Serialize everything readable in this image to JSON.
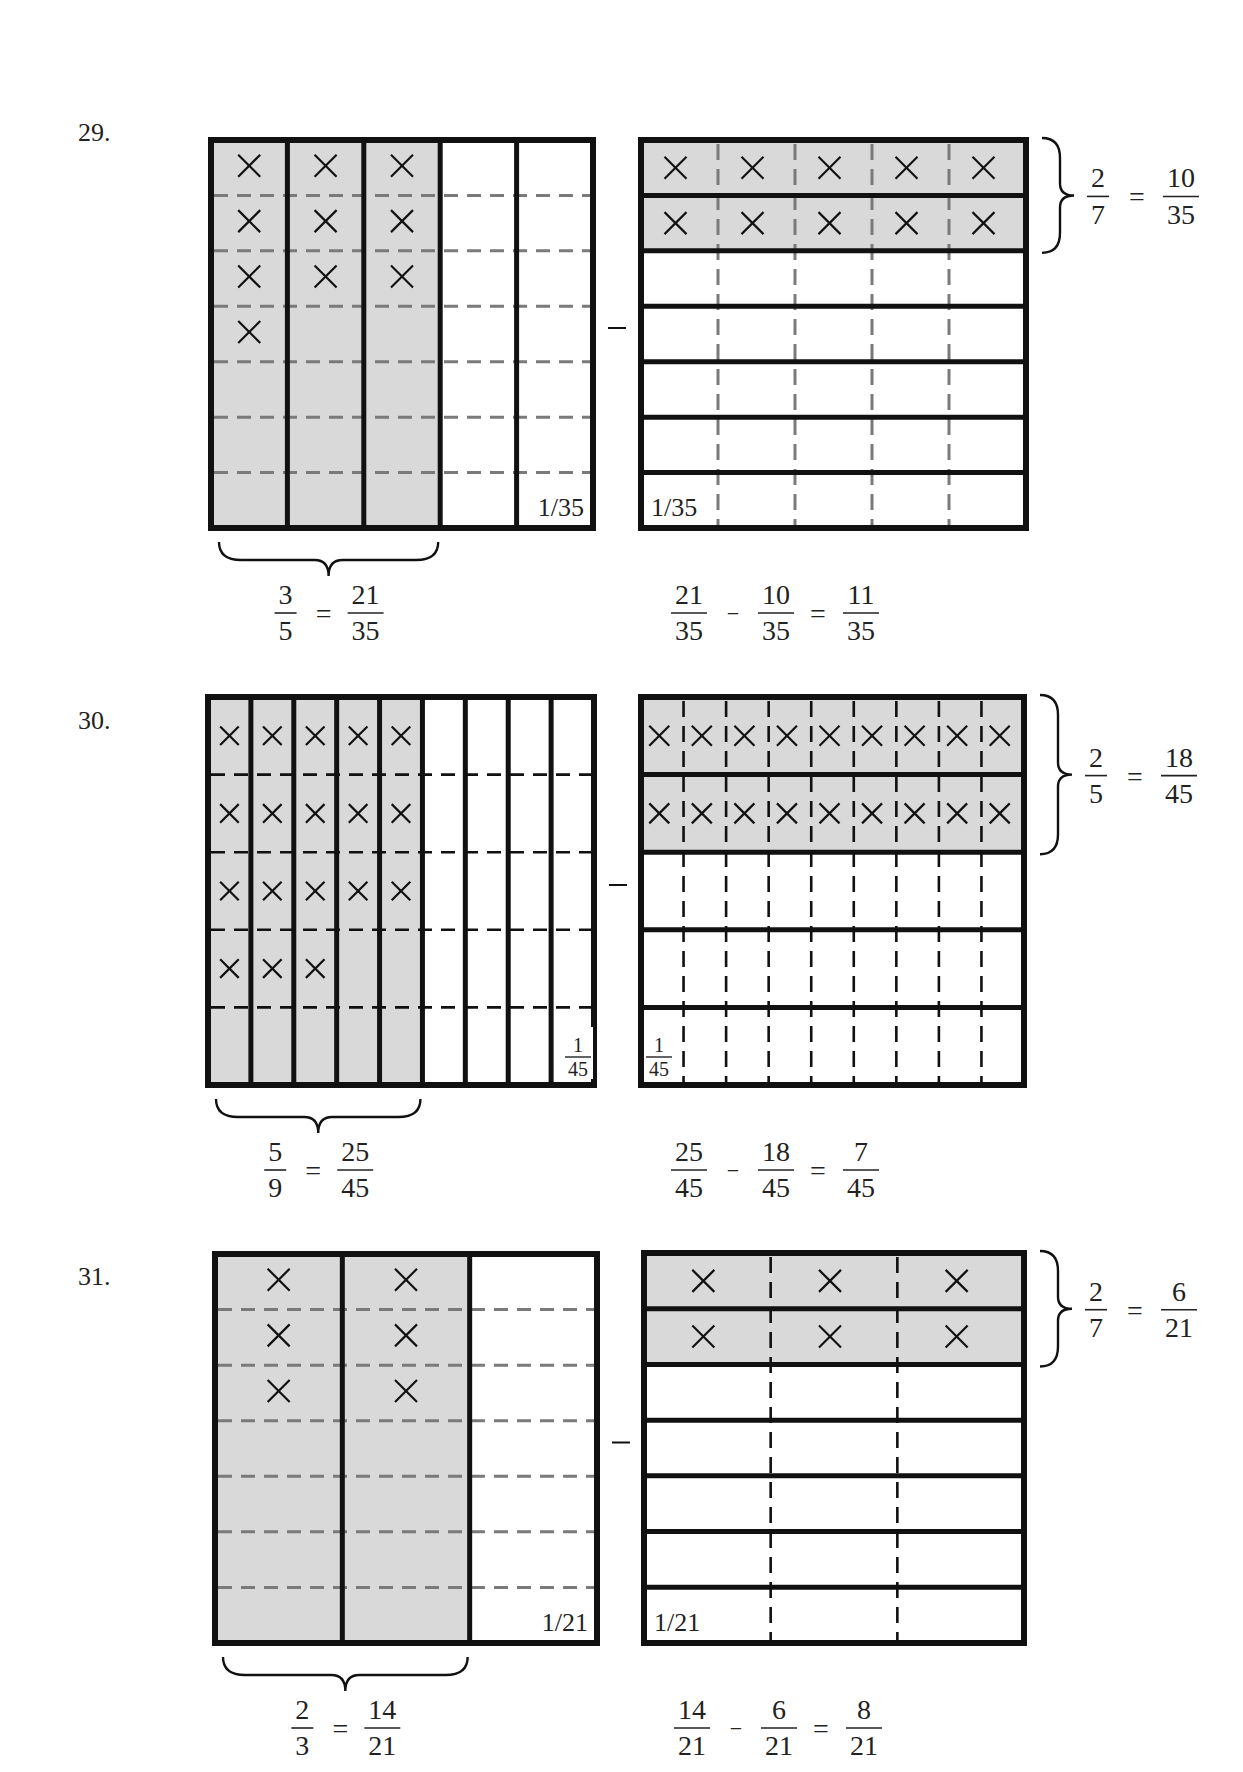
{
  "colors": {
    "shade": "#d9d9d9",
    "stroke": "#111111",
    "dash_gray": "#7a7a7a",
    "dash_black": "#111111",
    "text": "#222222"
  },
  "problems": [
    {
      "number": "29.",
      "label_pos": [
        78,
        128
      ],
      "left": {
        "x": 211,
        "y": 140,
        "w": 382,
        "h": 388,
        "cols": 5,
        "shaded_cols": 3,
        "rows": 7,
        "row_style": "dashed-gray",
        "col_style": "solid",
        "x_marks": 10,
        "unit_label": "1/35",
        "unit_label_pos": "bottom-right",
        "brace": {
          "side": "bottom",
          "span_cols": 3
        }
      },
      "minus": "−",
      "right": {
        "x": 641,
        "y": 140,
        "w": 385,
        "h": 388,
        "cols": 5,
        "rows": 7,
        "shaded_rows": 2,
        "row_style": "solid",
        "col_style": "dashed-gray",
        "x_marks": 10,
        "unit_label": "1/35",
        "unit_label_pos": "bottom-left",
        "brace": {
          "side": "right",
          "span_rows": 2
        }
      },
      "left_equation": {
        "a_num": "3",
        "a_den": "5",
        "op": "=",
        "b_num": "21",
        "b_den": "35"
      },
      "right_equation": {
        "a_num": "2",
        "a_den": "7",
        "op": "=",
        "b_num": "10",
        "b_den": "35"
      },
      "result": {
        "a_num": "21",
        "a_den": "35",
        "op1": "−",
        "b_num": "10",
        "b_den": "35",
        "op2": "=",
        "c_num": "11",
        "c_den": "35"
      }
    },
    {
      "number": "30.",
      "label_pos": [
        78,
        717
      ],
      "left": {
        "x": 208,
        "y": 697,
        "w": 386,
        "h": 388,
        "cols": 9,
        "shaded_cols": 5,
        "rows": 5,
        "row_style": "dashed-black",
        "col_style": "solid",
        "x_marks": 18,
        "unit_label": "1/45",
        "unit_label_pos": "bottom-right-stacked",
        "brace": {
          "side": "bottom",
          "span_cols": 5
        }
      },
      "minus": "−",
      "right": {
        "x": 641,
        "y": 697,
        "w": 383,
        "h": 388,
        "cols": 9,
        "rows": 5,
        "shaded_rows": 2,
        "row_style": "solid",
        "col_style": "dashed-black",
        "x_marks": 18,
        "unit_label": "1/45",
        "unit_label_pos": "bottom-left-stacked",
        "brace": {
          "side": "right",
          "span_rows": 2
        }
      },
      "left_equation": {
        "a_num": "5",
        "a_den": "9",
        "op": "=",
        "b_num": "25",
        "b_den": "45"
      },
      "right_equation": {
        "a_num": "2",
        "a_den": "5",
        "op": "=",
        "b_num": "18",
        "b_den": "45"
      },
      "result": {
        "a_num": "25",
        "a_den": "45",
        "op1": "−",
        "b_num": "18",
        "b_den": "45",
        "op2": "=",
        "c_num": "7",
        "c_den": "45"
      }
    },
    {
      "number": "31.",
      "label_pos": [
        78,
        1270
      ],
      "left": {
        "x": 215,
        "y": 1254,
        "w": 382,
        "h": 389,
        "cols": 3,
        "shaded_cols": 2,
        "rows": 7,
        "row_style": "dashed-gray",
        "col_style": "solid",
        "x_marks": 6,
        "unit_label": "1/21",
        "unit_label_pos": "bottom-right",
        "brace": {
          "side": "bottom",
          "span_cols": 2
        }
      },
      "minus": "−",
      "right": {
        "x": 644,
        "y": 1253,
        "w": 380,
        "h": 390,
        "cols": 3,
        "rows": 7,
        "shaded_rows": 2,
        "row_style": "solid",
        "col_style": "dashed-black",
        "x_marks": 6,
        "unit_label": "1/21",
        "unit_label_pos": "bottom-left",
        "brace": {
          "side": "right",
          "span_rows": 2
        }
      },
      "left_equation": {
        "a_num": "2",
        "a_den": "3",
        "op": "=",
        "b_num": "14",
        "b_den": "21"
      },
      "right_equation": {
        "a_num": "2",
        "a_den": "7",
        "op": "=",
        "b_num": "6",
        "b_den": "21"
      },
      "result": {
        "a_num": "14",
        "a_den": "21",
        "op1": "−",
        "b_num": "6",
        "b_den": "21",
        "op2": "=",
        "c_num": "8",
        "c_den": "21"
      }
    }
  ]
}
